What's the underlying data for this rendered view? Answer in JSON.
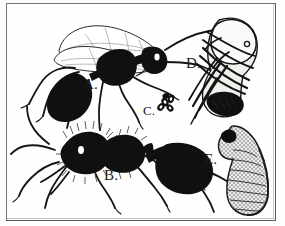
{
  "plate": {
    "title": "Ant life stages illustration plate",
    "style": "black-and-white scanned line engraving",
    "background_color": "#fdfdfd",
    "ink_color": "#101010",
    "frame": {
      "present": true,
      "color": "#5a5a5a",
      "style": "thin single rule rectangle"
    }
  },
  "figures": [
    {
      "key": "A",
      "label": "A.",
      "subject": "winged-ant",
      "description": "Winged reproductive ant (alate) in side view, facing right, two membranous wings raised over the back, dark head and gaster, long antennae and legs"
    },
    {
      "key": "B",
      "label": "B.",
      "subject": "worker-ant",
      "description": "Wingless worker ant in side view, facing left, hairy head and thorax, large dark gaster at right, six legs"
    },
    {
      "key": "C",
      "label": "C.",
      "subject": "egg-cluster",
      "description": "Small cluster of ant eggs drawn as a tiny rosette of pale ovals"
    },
    {
      "key": "D",
      "label": "D.",
      "subject": "pupa",
      "description": "Naked pupa, pale rounded head uppermost with developing legs and antennae folded in bands across the body"
    },
    {
      "key": "E",
      "label": "E.",
      "subject": "larva",
      "description": "Comma-shaped stippled larva with segmented body and small dark head curled at the top"
    }
  ],
  "labels": {
    "a": "A.",
    "b": "B.",
    "c": "C.",
    "d": "D.",
    "e": "E."
  }
}
